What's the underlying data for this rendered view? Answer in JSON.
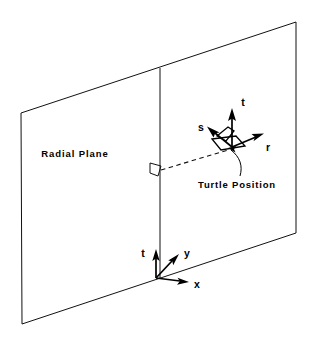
{
  "figure": {
    "background_color": "#ffffff",
    "line_color": "#111111",
    "labels": {
      "radial_plane": "Radial Plane",
      "turtle_position": "Turtle Position"
    },
    "turtle_frame": {
      "axes": [
        {
          "name": "s",
          "label": "s"
        },
        {
          "name": "t",
          "label": "t"
        },
        {
          "name": "r",
          "label": "r"
        }
      ]
    },
    "global_frame": {
      "axes": [
        {
          "name": "t",
          "label": "t"
        },
        {
          "name": "y",
          "label": "y"
        },
        {
          "name": "x",
          "label": "x"
        }
      ]
    },
    "geometry": {
      "plane_corners": [
        {
          "x": 21,
          "y": 113
        },
        {
          "x": 296,
          "y": 22
        },
        {
          "x": 296,
          "y": 233
        },
        {
          "x": 22,
          "y": 324
        }
      ],
      "vertical_line": {
        "x": 160,
        "y_top": 68,
        "y_bottom": 278
      },
      "perpendicular_marker": {
        "x": 150,
        "y": 163,
        "size": 11
      },
      "dashed_connector": {
        "x1": 161,
        "y1": 170,
        "x2": 228,
        "y2": 150
      },
      "turtle_origin": {
        "x": 232,
        "y": 147
      },
      "global_origin": {
        "x": 156,
        "y": 278
      }
    }
  }
}
